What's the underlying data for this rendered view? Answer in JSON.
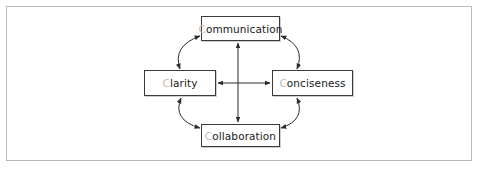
{
  "diagram": {
    "type": "concept-map",
    "nodes": [
      {
        "id": "communication",
        "initial": "C",
        "rest": "ommunication",
        "label": "Communication",
        "position": "top"
      },
      {
        "id": "clarity",
        "initial": "C",
        "rest": "larity",
        "label": "Clarity",
        "position": "left"
      },
      {
        "id": "conciseness",
        "initial": "C",
        "rest": "onciseness",
        "label": "Conciseness",
        "position": "right"
      },
      {
        "id": "collaboration",
        "initial": "C",
        "rest": "ollaboration",
        "label": "Collaboration",
        "position": "bottom"
      }
    ],
    "edges": [
      {
        "from": "communication",
        "to": "clarity",
        "style": "curved",
        "direction": "both"
      },
      {
        "from": "communication",
        "to": "conciseness",
        "style": "curved",
        "direction": "both"
      },
      {
        "from": "clarity",
        "to": "collaboration",
        "style": "curved",
        "direction": "both"
      },
      {
        "from": "conciseness",
        "to": "collaboration",
        "style": "curved",
        "direction": "both"
      },
      {
        "from": "communication",
        "to": "collaboration",
        "style": "straight",
        "direction": "both"
      },
      {
        "from": "clarity",
        "to": "conciseness",
        "style": "straight",
        "direction": "both"
      }
    ],
    "colors": {
      "frame": "#b9b9b9",
      "box_border": "#3a3a3a",
      "text": "#1a1a1a",
      "initial_letter": "#bdbdbd",
      "arrow": "#2a2a2a"
    }
  }
}
